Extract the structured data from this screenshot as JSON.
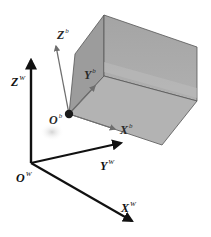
{
  "diagram": {
    "type": "coordinate-frames",
    "colors": {
      "world_axis": "#111111",
      "body_axis": "#6e6e6e",
      "box_fill": "#a9a9a9",
      "box_edge": "#555555",
      "origin_dot": "#1a1a1a"
    },
    "world_frame": {
      "origin_label": {
        "main": "O",
        "sup": "W"
      },
      "x_label": {
        "main": "X",
        "sup": "W"
      },
      "y_label": {
        "main": "Y",
        "sup": "W"
      },
      "z_label": {
        "main": "Z",
        "sup": "W"
      }
    },
    "body_frame": {
      "origin_label": {
        "main": "O",
        "sup": "b"
      },
      "x_label": {
        "main": "X",
        "sup": "b"
      },
      "y_label": {
        "main": "Y",
        "sup": "b"
      },
      "z_label": {
        "main": "Z",
        "sup": "b"
      }
    }
  }
}
